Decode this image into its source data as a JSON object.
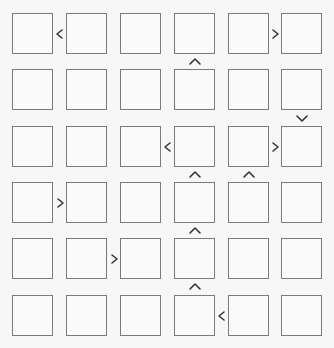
{
  "puzzle": {
    "type": "futoshiki",
    "size": 6,
    "colors": {
      "background": "#f7f7f7",
      "cell_border": "#7a7a7a",
      "sign": "#333333"
    },
    "cells": [
      [
        "",
        "",
        "",
        "",
        "",
        ""
      ],
      [
        "",
        "",
        "",
        "",
        "",
        ""
      ],
      [
        "",
        "",
        "",
        "",
        "",
        ""
      ],
      [
        "",
        "",
        "",
        "",
        "",
        ""
      ],
      [
        "",
        "",
        "",
        "",
        "",
        ""
      ],
      [
        "",
        "",
        "",
        "",
        "",
        ""
      ]
    ],
    "horizontal_signs": [
      {
        "row": 0,
        "left_col": 0,
        "sign": "<"
      },
      {
        "row": 0,
        "left_col": 4,
        "sign": ">"
      },
      {
        "row": 2,
        "left_col": 2,
        "sign": "<"
      },
      {
        "row": 2,
        "left_col": 4,
        "sign": ">"
      },
      {
        "row": 3,
        "left_col": 0,
        "sign": ">"
      },
      {
        "row": 4,
        "left_col": 1,
        "sign": ">"
      },
      {
        "row": 5,
        "left_col": 3,
        "sign": "<"
      }
    ],
    "vertical_signs": [
      {
        "top_row": 0,
        "col": 3,
        "sign": "^"
      },
      {
        "top_row": 1,
        "col": 5,
        "sign": "v"
      },
      {
        "top_row": 2,
        "col": 3,
        "sign": "^"
      },
      {
        "top_row": 2,
        "col": 4,
        "sign": "^"
      },
      {
        "top_row": 3,
        "col": 3,
        "sign": "^"
      },
      {
        "top_row": 4,
        "col": 3,
        "sign": "^"
      }
    ]
  }
}
